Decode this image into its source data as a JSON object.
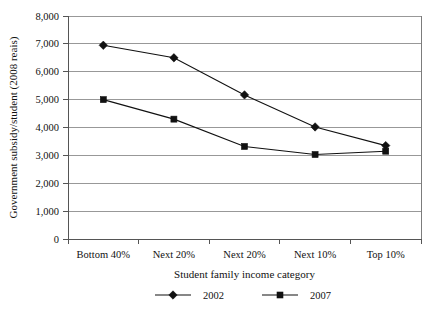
{
  "chart_data": {
    "type": "line",
    "title": "",
    "xlabel": "Student family income category",
    "ylabel": "Government subsidy/student (2008 reais)",
    "categories": [
      "Bottom 40%",
      "Next 20%",
      "Next 20%",
      "Next 10%",
      "Top 10%"
    ],
    "series": [
      {
        "name": "2002",
        "marker": "diamond",
        "color": "#111111",
        "values": [
          6950,
          6500,
          5170,
          4020,
          3350
        ]
      },
      {
        "name": "2007",
        "marker": "square",
        "color": "#111111",
        "values": [
          5000,
          4300,
          3320,
          3030,
          3150
        ]
      }
    ],
    "ylim": [
      0,
      8000
    ],
    "ytick_values": [
      0,
      1000,
      2000,
      3000,
      4000,
      5000,
      6000,
      7000,
      8000
    ],
    "ytick_labels": [
      "0",
      "1,000",
      "2,000",
      "3,000",
      "4,000",
      "5,000",
      "6,000",
      "7,000",
      "8,000"
    ],
    "grid": true,
    "grid_axis": "y",
    "legend_position": "bottom",
    "legend": [
      "2002",
      "2007"
    ]
  },
  "axes": {
    "y_title": "Government subsidy/student (2008 reais)",
    "x_title": "Student family income category"
  },
  "y_ticks": [
    {
      "label": "8,000",
      "value": 8000
    },
    {
      "label": "7,000",
      "value": 7000
    },
    {
      "label": "6,000",
      "value": 6000
    },
    {
      "label": "5,000",
      "value": 5000
    },
    {
      "label": "4,000",
      "value": 4000
    },
    {
      "label": "3,000",
      "value": 3000
    },
    {
      "label": "2,000",
      "value": 2000
    },
    {
      "label": "1,000",
      "value": 1000
    },
    {
      "label": "0",
      "value": 0
    }
  ],
  "x_categories": [
    {
      "label": "Bottom 40%"
    },
    {
      "label": "Next 20%"
    },
    {
      "label": "Next 20%"
    },
    {
      "label": "Next 10%"
    },
    {
      "label": "Top 10%"
    }
  ],
  "legend_items": [
    {
      "label": "2002",
      "marker": "diamond"
    },
    {
      "label": "2007",
      "marker": "square"
    }
  ]
}
